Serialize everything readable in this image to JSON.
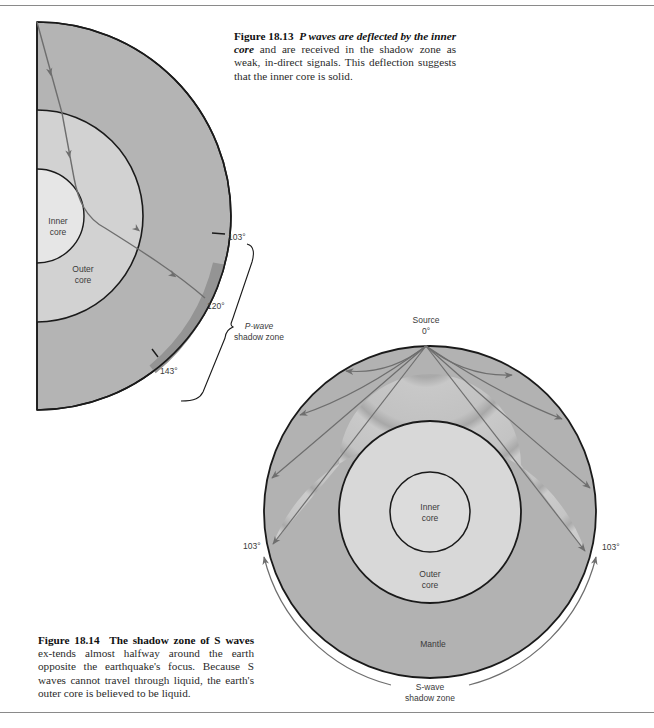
{
  "figure_18_13": {
    "caption": {
      "number": "Figure 18.13",
      "bold_title": "P waves are deflected by the inner core",
      "body": "and are received in the shadow zone as weak, in-direct signals. This deflection suggests that the inner core is solid."
    },
    "labels": {
      "inner_core_1": "Inner",
      "inner_core_2": "core",
      "outer_core_1": "Outer",
      "outer_core_2": "core",
      "angle_103": "103°",
      "angle_120": "120°",
      "angle_143": "143°",
      "shadow_zone_1": "P-wave",
      "shadow_zone_2": "shadow zone"
    }
  },
  "figure_18_14": {
    "caption": {
      "number": "Figure 18.14",
      "bold_title": "The shadow zone of S waves",
      "body": "ex-tends almost halfway around the earth opposite the earthquake's focus. Because S waves cannot travel through liquid, the earth's outer core is believed to be liquid."
    },
    "labels": {
      "source_1": "Source",
      "source_2": "0°",
      "inner_core_1": "Inner",
      "inner_core_2": "core",
      "outer_core_1": "Outer",
      "outer_core_2": "core",
      "mantle": "Mantle",
      "angle_left": "103°",
      "angle_right": "103°",
      "shadow_zone_1": "S-wave",
      "shadow_zone_2": "shadow zone"
    }
  },
  "colors": {
    "mantle": "#b4b4b4",
    "outer_core": "#d2d2d2",
    "inner_core": "#e6e6e6",
    "shadow_band": "#949494",
    "ray": "#6e6e6e",
    "outline": "#1a1a1a"
  }
}
